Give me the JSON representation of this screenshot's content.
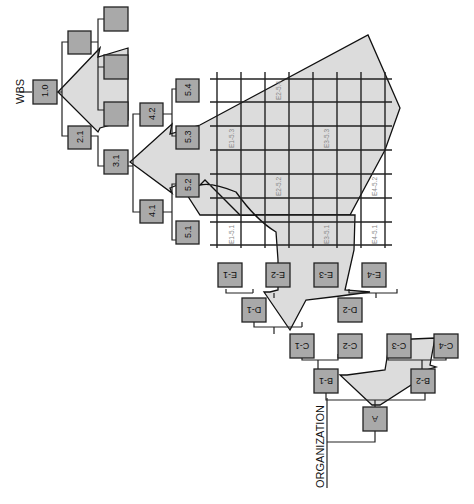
{
  "diagram": {
    "titles": {
      "wbs": "WBS",
      "organization": "ORGANIZATION"
    },
    "wbs_nodes": {
      "n10": "1.0",
      "n21": "2.1",
      "n31": "3.1",
      "n41": "4.1",
      "n42": "4.2",
      "n51": "5.1",
      "n52": "5.2",
      "n53": "5.3",
      "n54": "5.4"
    },
    "org_nodes": {
      "a": "A",
      "b1": "B-1",
      "b2": "B-2",
      "c1": "C-1",
      "c2": "C-2",
      "c3": "C-3",
      "c4": "C-4",
      "d1": "D-1",
      "d2": "D-2",
      "e1": "E-1",
      "e2": "E-2",
      "e3": "E-3",
      "e4": "E-4"
    },
    "matrix_cells": {
      "e1_51": "E1-5.1",
      "e1_53": "E1-5.3",
      "e2_52": "E2-5.2",
      "e2_54": "E2-5.4",
      "e3_51": "E3-5.1",
      "e3_53": "E3-5.3",
      "e4_51": "E4-5.1",
      "e4_52": "E4-5.2"
    },
    "colors": {
      "box_fill": "#a9a9a9",
      "region_fill": "#dcdcdc",
      "line": "#222222"
    }
  }
}
